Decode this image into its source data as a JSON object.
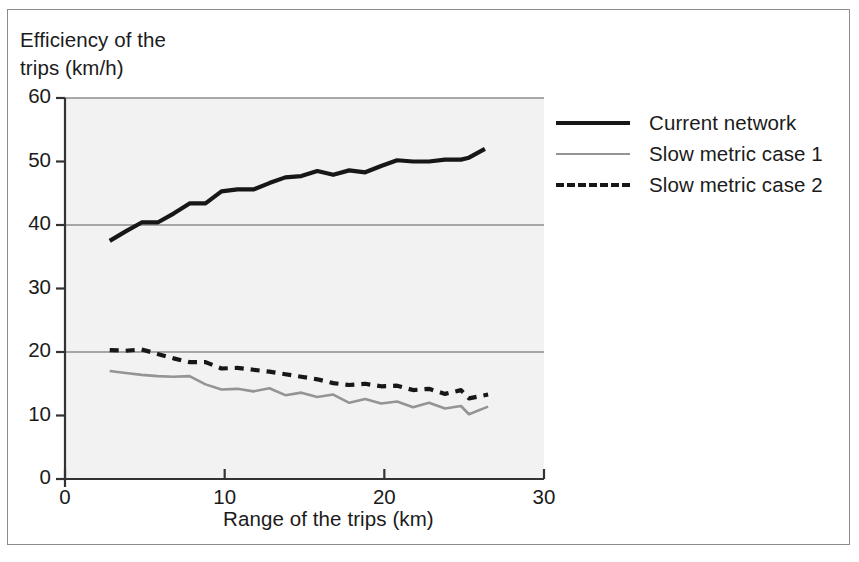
{
  "figure": {
    "background_color": "#ffffff",
    "border_color": "#8b8b8b",
    "plot_background_color": "#f2f2f2",
    "gridline_color": "#8c8c8c",
    "axis_color": "#333333"
  },
  "axis_titles": {
    "y_title": "Efficiency of the\ntrips (km/h)",
    "x_title": "Range of the trips (km)"
  },
  "ticks": {
    "y": [
      "0",
      "10",
      "20",
      "30",
      "40",
      "50",
      "60"
    ],
    "x": [
      "0",
      "10",
      "20",
      "30"
    ]
  },
  "legend": {
    "items": [
      {
        "label": "Current network",
        "style": "solid-thick",
        "color": "#171717"
      },
      {
        "label": "Slow metric case 1",
        "style": "solid-thin",
        "color": "#949494"
      },
      {
        "label": "Slow metric case 2",
        "style": "dashed",
        "color": "#171717"
      }
    ]
  },
  "chart_data": {
    "type": "line",
    "title": "",
    "xlabel": "Range of the trips (km)",
    "ylabel": "Efficiency of the trips (km/h)",
    "xlim": [
      0,
      30
    ],
    "ylim": [
      0,
      60
    ],
    "xticks": [
      0,
      10,
      20,
      30
    ],
    "yticks": [
      0,
      10,
      20,
      30,
      40,
      50,
      60
    ],
    "grid": "horizontal at 20, 40, 60",
    "legend_position": "right",
    "series": [
      {
        "name": "Current network",
        "color": "#171717",
        "style": "solid",
        "width": 4.2,
        "x": [
          2.8,
          3.8,
          4.8,
          5.8,
          6.8,
          7.8,
          8.8,
          9.8,
          10.8,
          11.8,
          12.8,
          13.8,
          14.8,
          15.8,
          16.8,
          17.8,
          18.8,
          19.8,
          20.8,
          21.8,
          22.8,
          23.8,
          24.8,
          25.3,
          26.3
        ],
        "y": [
          37.5,
          39.0,
          40.4,
          40.4,
          41.8,
          43.4,
          43.4,
          45.3,
          45.6,
          45.6,
          46.6,
          47.5,
          47.7,
          48.5,
          47.9,
          48.6,
          48.3,
          49.3,
          50.2,
          50.0,
          50.0,
          50.3,
          50.3,
          50.6,
          52.0
        ]
      },
      {
        "name": "Slow metric case 1",
        "color": "#949494",
        "style": "solid",
        "width": 2.6,
        "x": [
          2.8,
          3.8,
          4.8,
          5.8,
          6.8,
          7.8,
          8.8,
          9.8,
          10.8,
          11.8,
          12.8,
          13.8,
          14.8,
          15.8,
          16.8,
          17.8,
          18.8,
          19.8,
          20.8,
          21.8,
          22.8,
          23.8,
          24.8,
          25.3,
          26.5
        ],
        "y": [
          17.0,
          16.7,
          16.4,
          16.2,
          16.1,
          16.2,
          14.9,
          14.1,
          14.2,
          13.8,
          14.3,
          13.2,
          13.6,
          12.9,
          13.3,
          12.0,
          12.6,
          11.9,
          12.2,
          11.3,
          12.0,
          11.1,
          11.5,
          10.2,
          11.4
        ]
      },
      {
        "name": "Slow metric case 2",
        "color": "#171717",
        "style": "dashed",
        "width": 4.2,
        "x": [
          2.8,
          3.8,
          4.8,
          5.8,
          6.8,
          7.8,
          8.8,
          9.8,
          10.8,
          11.8,
          12.8,
          13.8,
          14.8,
          15.8,
          16.8,
          17.8,
          18.8,
          19.8,
          20.8,
          21.8,
          22.8,
          23.8,
          24.8,
          25.3,
          26.5
        ],
        "y": [
          20.3,
          20.2,
          20.4,
          19.7,
          19.0,
          18.4,
          18.4,
          17.4,
          17.5,
          17.2,
          16.9,
          16.5,
          16.1,
          15.7,
          15.1,
          14.8,
          15.0,
          14.6,
          14.7,
          14.0,
          14.2,
          13.4,
          14.0,
          12.7,
          13.3
        ]
      }
    ]
  }
}
